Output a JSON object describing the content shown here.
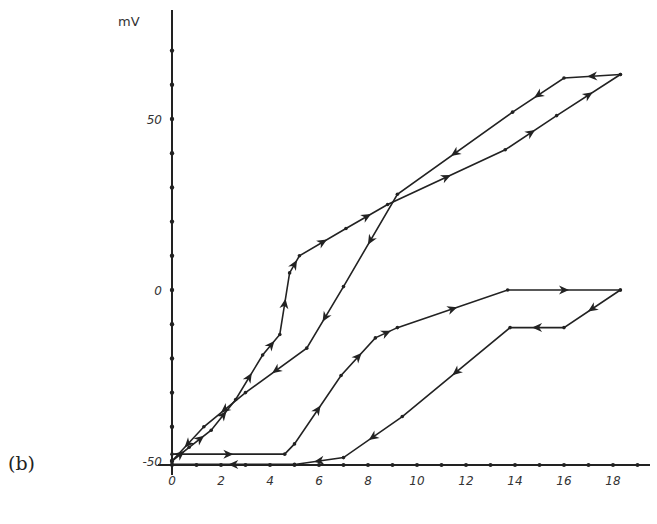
{
  "panel_label": "(b)",
  "chart_data": {
    "type": "line",
    "title": "",
    "xlabel": "",
    "ylabel": "mV",
    "xlim": [
      0,
      19
    ],
    "ylim": [
      -50,
      70
    ],
    "grid": false,
    "x_ticks": [
      0,
      2,
      4,
      6,
      8,
      10,
      12,
      14,
      16,
      18
    ],
    "x_tick_labels": [
      "0",
      "2",
      "4",
      "6",
      "8",
      "10",
      "12",
      "14",
      "16",
      "18"
    ],
    "y_ticks": [
      -50,
      0,
      50
    ],
    "y_tick_labels": [
      "-50",
      "0",
      "50"
    ],
    "series": [
      {
        "name": "upper loop - increasing",
        "x": [
          0,
          0.7,
          1.6,
          2.6,
          3.7,
          4.4,
          4.8,
          5.2,
          7.1,
          8.8,
          13.6,
          15.7,
          18.3
        ],
        "y": [
          -50,
          -46,
          -41,
          -32,
          -19,
          -13,
          5,
          10,
          18,
          25,
          41,
          51,
          63
        ]
      },
      {
        "name": "upper loop - decreasing",
        "x": [
          18.3,
          16.0,
          13.9,
          9.2,
          7.0,
          5.5,
          3.0,
          1.3,
          0
        ],
        "y": [
          63,
          62,
          52,
          28,
          1,
          -17,
          -30,
          -40,
          -50
        ]
      },
      {
        "name": "lower loop - increasing",
        "x": [
          0,
          4.6,
          5.0,
          6.9,
          8.3,
          9.2,
          13.7,
          18.3
        ],
        "y": [
          -48,
          -48,
          -45,
          -25,
          -14,
          -11,
          0,
          0
        ]
      },
      {
        "name": "lower loop - decreasing",
        "x": [
          18.3,
          16.0,
          13.8,
          9.4,
          7.0,
          5.0,
          0
        ],
        "y": [
          0,
          -11,
          -11,
          -37,
          -49,
          -51,
          -51
        ]
      }
    ],
    "legend": [],
    "annotations": [
      "(b)"
    ]
  }
}
